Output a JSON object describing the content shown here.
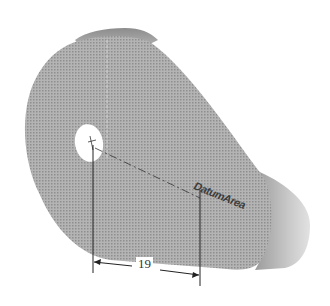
{
  "figure": {
    "dimension": {
      "value": "19"
    },
    "engraved_text": {
      "value": "DatumArea"
    },
    "colors": {
      "part_face": "#a8a8a8",
      "part_edge": "#8a8a8a",
      "hole": "#ffffff",
      "lines": "#222222",
      "background": "#ffffff"
    }
  }
}
